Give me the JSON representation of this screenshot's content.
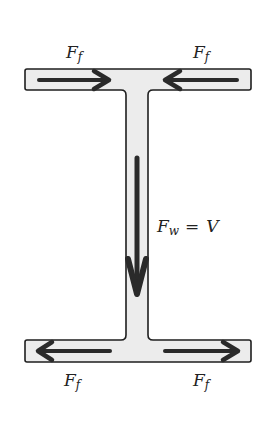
{
  "diagram": {
    "colors": {
      "fill": "#ececec",
      "outline": "#1e1e1e",
      "arrow": "#2a2a2a",
      "text": "#222222"
    },
    "labels": {
      "top_left": {
        "main": "F",
        "sub": "f"
      },
      "top_right": {
        "main": "F",
        "sub": "f"
      },
      "bottom_left": {
        "main": "F",
        "sub": "f"
      },
      "bottom_right": {
        "main": "F",
        "sub": "f"
      },
      "web": {
        "main": "F",
        "sub": "w",
        "eq": "=",
        "rhs": "V"
      }
    },
    "arrows": [
      {
        "id": "top-left-flange",
        "direction": "right"
      },
      {
        "id": "top-right-flange",
        "direction": "left"
      },
      {
        "id": "web",
        "direction": "down"
      },
      {
        "id": "bottom-left-flange",
        "direction": "left"
      },
      {
        "id": "bottom-right-flange",
        "direction": "right"
      }
    ]
  }
}
